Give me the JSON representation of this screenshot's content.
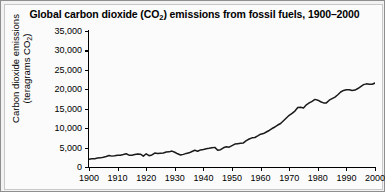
{
  "chart_data": {
    "type": "line",
    "title": "Global carbon dioxide (CO2) emissions from fossil fuels, 1900–2000",
    "title_parts": {
      "before": "Global carbon dioxide (CO",
      "sub": "2",
      "after": ") emissions from fossil fuels, 1900–2000"
    },
    "xlabel": "",
    "ylabel": "Carbon dioxide emissions (teragrams CO2)",
    "ylabel_line1": "Carbon dioxide emissions",
    "ylabel_line2_before": "(teragrams CO",
    "ylabel_line2_sub": "2",
    "ylabel_line2_after": ")",
    "xlim": [
      1900,
      2000
    ],
    "ylim": [
      0,
      35000
    ],
    "grid": false,
    "legend": null,
    "line_color": "#1a1a1a",
    "background_color": "#fbfbfb",
    "ytick_labels": [
      "35,000",
      "30,000",
      "25,000",
      "20,000",
      "15,000",
      "10,000",
      "5,000",
      "0"
    ],
    "ytick_values": [
      35000,
      30000,
      25000,
      20000,
      15000,
      10000,
      5000,
      0
    ],
    "xtick_labels": [
      "1900",
      "1910",
      "1920",
      "1930",
      "1940",
      "1950",
      "1960",
      "1970",
      "1980",
      "1990",
      "2000"
    ],
    "xtick_values": [
      1900,
      1910,
      1920,
      1930,
      1940,
      1950,
      1960,
      1970,
      1980,
      1990,
      2000
    ],
    "x": [
      1900,
      1901,
      1902,
      1903,
      1904,
      1905,
      1906,
      1907,
      1908,
      1909,
      1910,
      1911,
      1912,
      1913,
      1914,
      1915,
      1916,
      1917,
      1918,
      1919,
      1920,
      1921,
      1922,
      1923,
      1924,
      1925,
      1926,
      1927,
      1928,
      1929,
      1930,
      1931,
      1932,
      1933,
      1934,
      1935,
      1936,
      1937,
      1938,
      1939,
      1940,
      1941,
      1942,
      1943,
      1944,
      1945,
      1946,
      1947,
      1948,
      1949,
      1950,
      1951,
      1952,
      1953,
      1954,
      1955,
      1956,
      1957,
      1958,
      1959,
      1960,
      1961,
      1962,
      1963,
      1964,
      1965,
      1966,
      1967,
      1968,
      1969,
      1970,
      1971,
      1972,
      1973,
      1974,
      1975,
      1976,
      1977,
      1978,
      1979,
      1980,
      1981,
      1982,
      1983,
      1984,
      1985,
      1986,
      1987,
      1988,
      1989,
      1990,
      1991,
      1992,
      1993,
      1994,
      1995,
      1996,
      1997,
      1998,
      1999,
      2000
    ],
    "y": [
      2000,
      2100,
      2150,
      2300,
      2350,
      2500,
      2700,
      2950,
      2800,
      2900,
      3050,
      3050,
      3200,
      3400,
      3050,
      3000,
      3200,
      3350,
      3300,
      2800,
      3400,
      2900,
      3100,
      3600,
      3500,
      3550,
      3600,
      3850,
      3900,
      4100,
      3800,
      3400,
      3100,
      3250,
      3500,
      3650,
      4000,
      4300,
      4050,
      4400,
      4500,
      4700,
      4800,
      4950,
      5050,
      4300,
      4450,
      4950,
      5200,
      5100,
      5500,
      5900,
      6000,
      6100,
      6200,
      6800,
      7200,
      7500,
      7600,
      8000,
      8450,
      8600,
      9000,
      9400,
      9900,
      10300,
      10800,
      11200,
      11900,
      12600,
      13300,
      13800,
      14400,
      15300,
      15400,
      15200,
      16000,
      16500,
      16900,
      17400,
      17200,
      16800,
      16500,
      16500,
      17200,
      17600,
      18000,
      18600,
      19300,
      19700,
      19900,
      19900,
      19700,
      19800,
      20200,
      20700,
      21200,
      21400,
      21300,
      21300,
      21600
    ]
  },
  "axis": {
    "tick_color": "#000000",
    "font_size": "9px"
  }
}
